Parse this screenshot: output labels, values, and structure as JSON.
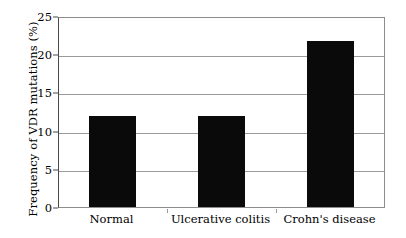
{
  "chart_data": {
    "type": "bar",
    "title": "",
    "subtitle": "",
    "xlabel": "",
    "ylabel": "Frequency of VDR mutations (%)",
    "categories": [
      "Normal",
      "Ulcerative colitis",
      "Crohn's disease"
    ],
    "values": [
      12,
      12,
      22
    ],
    "ylim": [
      0,
      25
    ],
    "yticks": [
      0,
      5,
      10,
      15,
      20,
      25
    ],
    "grid": "horizontal",
    "legend": "none",
    "bar_color": "#0a0a0a",
    "grid_color": "#9a9a9a",
    "axis_color": "#4a4a4a",
    "background_color": "#ffffff"
  }
}
